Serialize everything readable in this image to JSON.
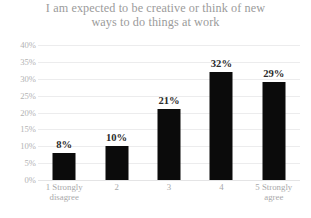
{
  "chart_data": {
    "type": "bar",
    "title": "I am expected to be creative or think of new ways to do things at work",
    "title_lines": [
      "I am expected to be creative or think of new",
      "ways to do things at work"
    ],
    "categories": [
      "1 Strongly disagree",
      "2",
      "3",
      "4",
      "5 Strongly agree"
    ],
    "category_lines": [
      [
        "1 Strongly",
        "disagree"
      ],
      [
        "2"
      ],
      [
        "3"
      ],
      [
        "4"
      ],
      [
        "5 Strongly",
        "agree"
      ]
    ],
    "values": [
      8,
      10,
      21,
      32,
      29
    ],
    "data_labels": [
      "8%",
      "10%",
      "21%",
      "32%",
      "29%"
    ],
    "xlabel": "",
    "ylabel": "",
    "ylim": [
      0,
      40
    ],
    "ytick_values": [
      40,
      35,
      30,
      25,
      20,
      15,
      10,
      5,
      0
    ],
    "ytick_labels": [
      "40%",
      "35%",
      "30%",
      "25%",
      "20%",
      "15%",
      "10%",
      "5%",
      "0%"
    ],
    "grid": true,
    "legend": false,
    "bar_color": "#0b0b0b",
    "grid_color": "#ececed",
    "title_color": "#9b9b9b",
    "axis_label_color": "#a9a9aa",
    "data_label_color": "#2b2b2b",
    "background_color": "#ffffff"
  }
}
